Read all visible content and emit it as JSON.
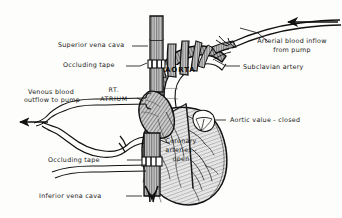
{
  "figure": {
    "ink_color": "#1a1a1a",
    "paper_color": "#fdfdfb",
    "tissue_tone": "#9a9a9a"
  },
  "labels": {
    "superior_vena_cava": "Superior vena cava",
    "occluding_tape_upper": "Occluding tape",
    "venous_outflow_line1": "Venous blood",
    "venous_outflow_line2": "outflow to pump",
    "rt_atrium_line1": "RT.",
    "rt_atrium_line2": "ATRIUM",
    "aorta": "AORTA",
    "subclavian_artery": "Subclavian artery",
    "arterial_inflow_line1": "Arterial blood inflow",
    "arterial_inflow_line2": "from pump",
    "aortic_valve": "Aortic value - closed",
    "coronary_line1": "Coronary",
    "coronary_line2": "arteries -",
    "coronary_line3": "open",
    "occluding_tape_lower": "Occluding tape",
    "inferior_vena_cava": "Inferior vena cava"
  }
}
